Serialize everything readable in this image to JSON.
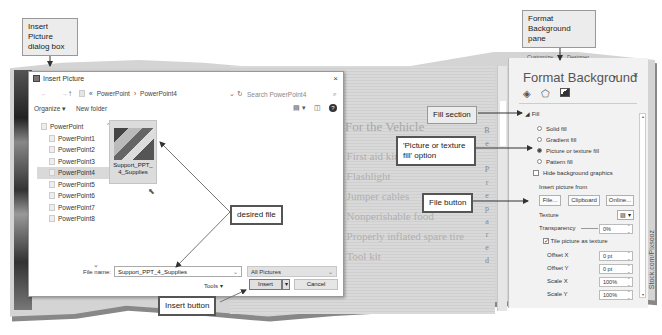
{
  "callouts": {
    "insert_picture_dialog": "Insert Picture dialog box",
    "format_background_pane": "Format Background pane",
    "fill_section": "Fill section",
    "picture_texture_option": "'Picture or texture fill' option",
    "file_button": "File button",
    "desired_file": "desired file",
    "insert_button": "Insert button"
  },
  "dialog": {
    "title": "Insert Picture",
    "close": "×",
    "nav_arrows": "← →",
    "up_icon": "↑",
    "breadcrumb": [
      "«",
      "PowerPoint",
      "›",
      "PowerPoint4"
    ],
    "breadcrumb_dropdown": "⌄ ↻",
    "search_placeholder": "Search PowerPoint4",
    "search_icon": "⌕",
    "organize": "Organize ▾",
    "new_folder": "New folder",
    "view_icon": "▤ ▾",
    "pane_icon": "◫",
    "help_icon": "?",
    "tree": [
      {
        "label": "PowerPoint",
        "root": true
      },
      {
        "label": "PowerPoint1"
      },
      {
        "label": "PowerPoint2"
      },
      {
        "label": "PowerPoint3"
      },
      {
        "label": "PowerPoint4",
        "selected": true
      },
      {
        "label": "PowerPoint5"
      },
      {
        "label": "PowerPoint6"
      },
      {
        "label": "PowerPoint7"
      },
      {
        "label": "PowerPoint8"
      }
    ],
    "tree_chevron": "^",
    "tree_more": "⌄",
    "file": {
      "name": "Support_PPT_4_Supplies"
    },
    "file_name_label": "File name:",
    "file_name_value": "Support_PPT_4_Supplies",
    "file_type": "All Pictures",
    "tools": "Tools  ▾",
    "insert": "Insert",
    "insert_dd": "▾",
    "cancel": "Cancel"
  },
  "slide": {
    "title": "For the Vehicle",
    "bullets": [
      "First aid kit",
      "Flashlight",
      "Jumper cables",
      "Nonperishable food",
      "Properly inflated spare tire",
      "Tool kit"
    ],
    "vertical_text": [
      "B",
      "e",
      "",
      "P",
      "r",
      "e",
      "p",
      "a",
      "r",
      "e",
      "d"
    ]
  },
  "pane": {
    "tabs": [
      "Customize",
      "Designer"
    ],
    "title": "Format Background",
    "pin": "▾",
    "close": "×",
    "fill_header": "◢ Fill",
    "options": [
      {
        "label": "Solid fill",
        "type": "radio",
        "on": false
      },
      {
        "label": "Gradient fill",
        "type": "radio",
        "on": false
      },
      {
        "label": "Picture or texture fill",
        "type": "radio",
        "on": true
      },
      {
        "label": "Pattern fill",
        "type": "radio",
        "on": false
      },
      {
        "label": "Hide background graphics",
        "type": "check",
        "on": false
      }
    ],
    "insert_from": "Insert picture from",
    "btn_file": "File...",
    "btn_clipboard": "Clipboard",
    "btn_online": "Online...",
    "texture": "Texture",
    "texture_btn": "▨ ▾",
    "transparency": "Transparency",
    "transparency_value": "0%",
    "tile": "Tile picture as texture",
    "offset_x": "Offset X",
    "offset_x_value": "0 pt",
    "offset_y": "Offset Y",
    "offset_y_value": "0 pt",
    "scale_x": "Scale X",
    "scale_x_value": "100%",
    "scale_y": "Scale Y",
    "scale_y_value": "100%"
  },
  "credit": "Stock.com/Pixsooz"
}
